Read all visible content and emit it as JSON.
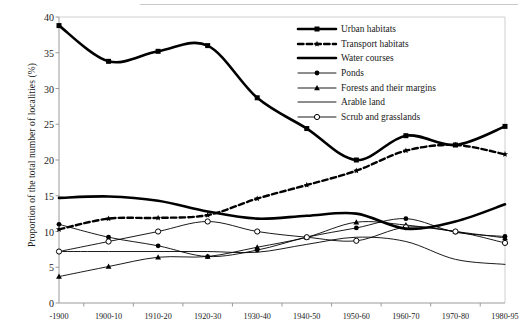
{
  "chart_data": {
    "type": "line",
    "title": "",
    "xlabel": "",
    "ylabel": "Proportion of the total number of localities (%)",
    "categories": [
      "-1900",
      "1900-10",
      "1910-20",
      "1920-30",
      "1930-40",
      "1940-50",
      "1950-60",
      "1960-70",
      "1970-80",
      "1980-95"
    ],
    "ylim": [
      0,
      40
    ],
    "yticks": [
      0,
      5,
      10,
      15,
      20,
      25,
      30,
      35,
      40
    ],
    "grid": false,
    "legend_position": "top-right",
    "series": [
      {
        "name": "Urban habitats",
        "marker": "square-filled",
        "style": "solid-thick",
        "values": [
          38.8,
          33.8,
          35.2,
          36.0,
          28.7,
          24.4,
          20.0,
          23.4,
          22.1,
          24.7
        ]
      },
      {
        "name": "Transport habitats",
        "marker": "star",
        "style": "dashed-thick",
        "values": [
          10.3,
          11.8,
          11.9,
          12.3,
          14.6,
          16.5,
          18.5,
          21.3,
          22.1,
          20.8
        ]
      },
      {
        "name": "Water courses",
        "marker": "none",
        "style": "solid-thick",
        "values": [
          14.7,
          14.9,
          14.3,
          12.8,
          11.8,
          12.2,
          12.5,
          10.4,
          11.4,
          13.8
        ]
      },
      {
        "name": "Ponds",
        "marker": "circle-filled",
        "style": "solid-thin",
        "values": [
          11.0,
          9.2,
          8.0,
          6.5,
          7.4,
          9.2,
          10.5,
          11.8,
          9.9,
          9.3
        ]
      },
      {
        "name": "Forests and their margins",
        "marker": "triangle",
        "style": "solid-thin",
        "values": [
          3.7,
          5.1,
          6.4,
          6.5,
          7.8,
          9.2,
          11.3,
          10.9,
          10.0,
          9.1
        ]
      },
      {
        "name": "Arable land",
        "marker": "none",
        "style": "solid-thin",
        "values": [
          7.2,
          7.2,
          7.2,
          7.2,
          7.1,
          8.2,
          9.2,
          8.6,
          6.1,
          5.4
        ]
      },
      {
        "name": "Scrub and grasslands",
        "marker": "circle-open",
        "style": "solid-thin",
        "values": [
          7.2,
          8.6,
          10.0,
          11.4,
          10.0,
          9.2,
          8.7,
          10.6,
          10.0,
          8.4
        ]
      }
    ]
  },
  "legend": {
    "items": [
      {
        "label": "Urban habitats"
      },
      {
        "label": "Transport habitats"
      },
      {
        "label": "Water courses"
      },
      {
        "label": "Ponds"
      },
      {
        "label": "Forests and their margins"
      },
      {
        "label": "Arable land"
      },
      {
        "label": "Scrub and grasslands"
      }
    ]
  }
}
